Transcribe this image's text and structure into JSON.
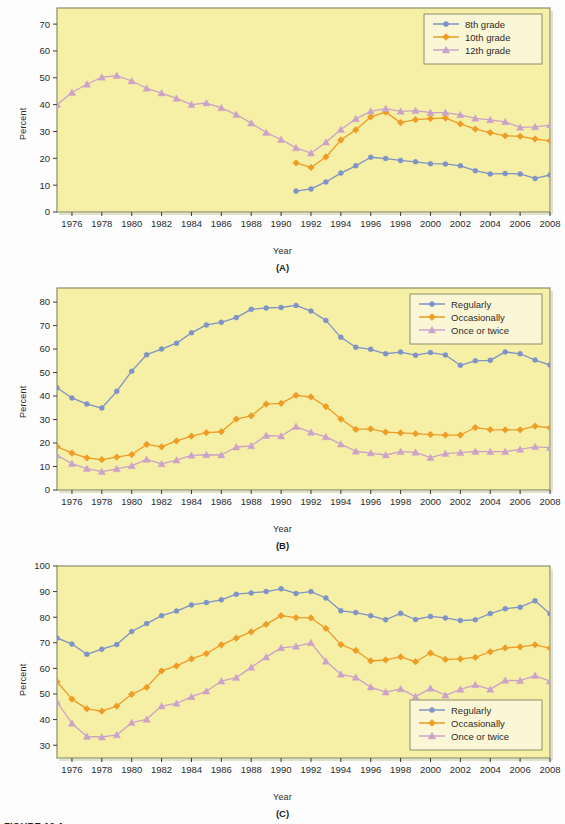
{
  "figure": {
    "caption": "FIGURE 12-1"
  },
  "colors": {
    "plot_background": "#f6efa6",
    "plot_border": "#8d8f6a",
    "axis": "#3a3a3a",
    "series_blue": "#7f93c6",
    "series_orange": "#ee9c24",
    "series_pink": "#ccA3c8",
    "legend_background": "#fbf7d6",
    "legend_border": "#8d8f6a",
    "text": "#2b2b2b"
  },
  "panels": [
    {
      "tag": "(A)",
      "chart_data": {
        "type": "line",
        "title": "",
        "xlabel": "Year",
        "ylabel": "Percent",
        "xlim": [
          1975,
          2008
        ],
        "ylim": [
          0,
          76
        ],
        "yticks": [
          0,
          10,
          20,
          30,
          40,
          50,
          60,
          70
        ],
        "xticks": [
          1976,
          1978,
          1980,
          1982,
          1984,
          1986,
          1988,
          1990,
          1992,
          1994,
          1996,
          1998,
          2000,
          2002,
          2004,
          2006,
          2008
        ],
        "grid": false,
        "legend_position": "top-right",
        "series": [
          {
            "name": "8th grade",
            "color": "#7f93c6",
            "marker": "circle",
            "x": [
              1991,
              1992,
              1993,
              1994,
              1995,
              1996,
              1997,
              1998,
              1999,
              2000,
              2001,
              2002,
              2003,
              2004,
              2005,
              2006,
              2007,
              2008
            ],
            "values": [
              7.8,
              8.6,
              11.2,
              14.5,
              17.2,
              20.4,
              19.9,
              19.2,
              18.7,
              18.0,
              17.9,
              17.2,
              15.4,
              14.2,
              14.3,
              14.2,
              12.5,
              13.8
            ]
          },
          {
            "name": "10th grade",
            "color": "#ee9c24",
            "marker": "diamond",
            "x": [
              1991,
              1992,
              1993,
              1994,
              1995,
              1996,
              1997,
              1998,
              1999,
              2000,
              2001,
              2002,
              2003,
              2004,
              2005,
              2006,
              2007,
              2008
            ],
            "values": [
              18.3,
              16.6,
              20.5,
              26.8,
              30.6,
              35.4,
              37.2,
              33.3,
              34.4,
              34.8,
              35.0,
              32.8,
              30.9,
              29.6,
              28.4,
              28.2,
              27.2,
              26.5
            ]
          },
          {
            "name": "12th grade",
            "color": "#ccA3c8",
            "marker": "triangle",
            "x": [
              1975,
              1976,
              1977,
              1978,
              1979,
              1980,
              1981,
              1982,
              1983,
              1984,
              1985,
              1986,
              1987,
              1988,
              1989,
              1990,
              1991,
              1992,
              1993,
              1994,
              1995,
              1996,
              1997,
              1998,
              1999,
              2000,
              2001,
              2002,
              2003,
              2004,
              2005,
              2006,
              2007,
              2008
            ],
            "values": [
              40.0,
              44.5,
              47.6,
              50.2,
              50.8,
              48.8,
              46.1,
              44.3,
              42.3,
              40.0,
              40.6,
              38.8,
              36.3,
              33.1,
              29.6,
              27.0,
              23.9,
              21.9,
              26.0,
              30.7,
              34.7,
              37.5,
              38.5,
              37.5,
              37.8,
              37.0,
              37.0,
              36.2,
              34.9,
              34.3,
              33.6,
              31.5,
              31.7,
              32.4
            ]
          }
        ]
      }
    },
    {
      "tag": "(B)",
      "chart_data": {
        "type": "line",
        "title": "",
        "xlabel": "Year",
        "ylabel": "Percent",
        "xlim": [
          1975,
          2008
        ],
        "ylim": [
          0,
          86
        ],
        "yticks": [
          0,
          10,
          20,
          30,
          40,
          50,
          60,
          70,
          80
        ],
        "xticks": [
          1976,
          1978,
          1980,
          1982,
          1984,
          1986,
          1988,
          1990,
          1992,
          1994,
          1996,
          1998,
          2000,
          2002,
          2004,
          2006,
          2008
        ],
        "grid": false,
        "legend_position": "top-right",
        "series": [
          {
            "name": "Regularly",
            "color": "#7f93c6",
            "marker": "circle",
            "x": [
              1975,
              1976,
              1977,
              1978,
              1979,
              1980,
              1981,
              1982,
              1983,
              1984,
              1985,
              1986,
              1987,
              1988,
              1989,
              1990,
              1991,
              1992,
              1993,
              1994,
              1995,
              1996,
              1997,
              1998,
              1999,
              2000,
              2001,
              2002,
              2003,
              2004,
              2005,
              2006,
              2007,
              2008
            ],
            "values": [
              43.5,
              39.2,
              36.6,
              34.9,
              42.0,
              50.6,
              57.6,
              60.0,
              62.5,
              66.9,
              70.3,
              71.4,
              73.4,
              76.9,
              77.5,
              77.7,
              78.6,
              76.2,
              72.2,
              65.0,
              60.8,
              59.9,
              58.0,
              58.7,
              57.4,
              58.5,
              57.5,
              53.1,
              55.0,
              55.2,
              58.8,
              58.0,
              55.3,
              53.2
            ]
          },
          {
            "name": "Occasionally",
            "color": "#ee9c24",
            "marker": "diamond",
            "x": [
              1975,
              1976,
              1977,
              1978,
              1979,
              1980,
              1981,
              1982,
              1983,
              1984,
              1985,
              1986,
              1987,
              1988,
              1989,
              1990,
              1991,
              1992,
              1993,
              1994,
              1995,
              1996,
              1997,
              1998,
              1999,
              2000,
              2001,
              2002,
              2003,
              2004,
              2005,
              2006,
              2007,
              2008
            ],
            "values": [
              18.5,
              15.7,
              13.7,
              12.9,
              14.0,
              15.1,
              19.4,
              18.4,
              20.9,
              22.9,
              24.4,
              24.8,
              30.2,
              31.6,
              36.6,
              36.9,
              40.3,
              39.6,
              35.5,
              30.2,
              25.8,
              26.0,
              24.6,
              24.3,
              24.0,
              23.6,
              23.4,
              23.4,
              26.6,
              25.7,
              25.6,
              25.6,
              27.2,
              26.5
            ]
          },
          {
            "name": "Once or twice",
            "color": "#ccA3c8",
            "marker": "triangle",
            "x": [
              1975,
              1976,
              1977,
              1978,
              1979,
              1980,
              1981,
              1982,
              1983,
              1984,
              1985,
              1986,
              1987,
              1988,
              1989,
              1990,
              1991,
              1992,
              1993,
              1994,
              1995,
              1996,
              1997,
              1998,
              1999,
              2000,
              2001,
              2002,
              2003,
              2004,
              2005,
              2006,
              2007,
              2008
            ],
            "values": [
              14.8,
              11.2,
              9.1,
              7.8,
              9.0,
              10.3,
              13.0,
              11.1,
              12.7,
              14.7,
              15.0,
              14.9,
              18.3,
              18.8,
              23.2,
              22.9,
              27.0,
              24.5,
              22.6,
              19.5,
              16.5,
              15.7,
              14.9,
              16.3,
              16.0,
              13.8,
              15.5,
              15.9,
              16.4,
              16.3,
              16.3,
              17.3,
              18.4,
              18.0
            ]
          }
        ]
      }
    },
    {
      "tag": "(C)",
      "chart_data": {
        "type": "line",
        "title": "",
        "xlabel": "Year",
        "ylabel": "Percent",
        "xlim": [
          1975,
          2008
        ],
        "ylim": [
          25,
          100
        ],
        "yticks": [
          30,
          40,
          50,
          60,
          70,
          80,
          90,
          100
        ],
        "xticks": [
          1976,
          1978,
          1980,
          1982,
          1984,
          1986,
          1988,
          1990,
          1992,
          1994,
          1996,
          1998,
          2000,
          2002,
          2004,
          2006,
          2008
        ],
        "grid": false,
        "legend_position": "bottom-right",
        "series": [
          {
            "name": "Regularly",
            "color": "#7f93c6",
            "marker": "circle",
            "x": [
              1975,
              1976,
              1977,
              1978,
              1979,
              1980,
              1981,
              1982,
              1983,
              1984,
              1985,
              1986,
              1987,
              1988,
              1989,
              1990,
              1991,
              1992,
              1993,
              1994,
              1995,
              1996,
              1997,
              1998,
              1999,
              2000,
              2001,
              2002,
              2003,
              2004,
              2005,
              2006,
              2007,
              2008
            ],
            "values": [
              71.9,
              69.5,
              65.5,
              67.5,
              69.3,
              74.4,
              77.5,
              80.6,
              82.4,
              84.8,
              85.7,
              86.8,
              89.0,
              89.5,
              90.0,
              91.1,
              89.3,
              90.0,
              87.5,
              82.5,
              81.8,
              80.6,
              79.0,
              81.5,
              79.1,
              80.3,
              79.7,
              78.7,
              79.0,
              81.4,
              83.3,
              83.9,
              86.4,
              81.3
            ]
          },
          {
            "name": "Occasionally",
            "color": "#ee9c24",
            "marker": "diamond",
            "x": [
              1975,
              1976,
              1977,
              1978,
              1979,
              1980,
              1981,
              1982,
              1983,
              1984,
              1985,
              1986,
              1987,
              1988,
              1989,
              1990,
              1991,
              1992,
              1993,
              1994,
              1995,
              1996,
              1997,
              1998,
              1999,
              2000,
              2001,
              2002,
              2003,
              2004,
              2005,
              2006,
              2007,
              2008
            ],
            "values": [
              54.8,
              48.0,
              44.2,
              43.3,
              45.3,
              49.9,
              52.6,
              59.0,
              61.0,
              63.7,
              65.8,
              69.2,
              71.8,
              74.3,
              77.2,
              80.6,
              79.8,
              79.7,
              75.6,
              69.3,
              67.0,
              62.9,
              63.3,
              64.5,
              62.6,
              66.0,
              63.5,
              63.7,
              64.3,
              66.5,
              68.0,
              68.4,
              69.2,
              67.9
            ]
          },
          {
            "name": "Once or twice",
            "color": "#ccA3c8",
            "marker": "triangle",
            "x": [
              1975,
              1976,
              1977,
              1978,
              1979,
              1980,
              1981,
              1982,
              1983,
              1984,
              1985,
              1986,
              1987,
              1988,
              1989,
              1990,
              1991,
              1992,
              1993,
              1994,
              1995,
              1996,
              1997,
              1998,
              1999,
              2000,
              2001,
              2002,
              2003,
              2004,
              2005,
              2006,
              2007,
              2008
            ],
            "values": [
              46.9,
              38.5,
              33.4,
              33.2,
              34.0,
              38.8,
              40.1,
              45.3,
              46.3,
              48.9,
              51.1,
              55.0,
              56.4,
              60.4,
              64.4,
              68.0,
              68.6,
              70.0,
              62.8,
              57.7,
              56.5,
              52.7,
              50.7,
              52.0,
              49.0,
              52.2,
              49.5,
              51.8,
              53.6,
              51.8,
              55.3,
              55.2,
              57.2,
              55.0
            ]
          }
        ]
      }
    }
  ]
}
